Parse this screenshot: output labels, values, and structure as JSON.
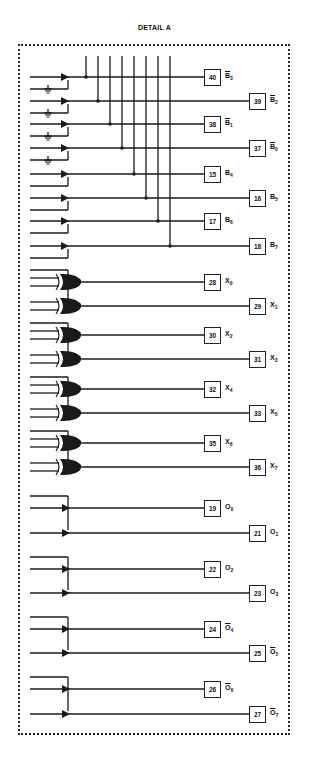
{
  "title": "DETAIL A",
  "bus_lines_x": [
    86,
    98,
    110,
    122,
    134,
    146,
    158,
    170
  ],
  "groups": {
    "buffers": {
      "rows": [
        {
          "pin": "40",
          "signal": "B",
          "sub": "3",
          "bar": true,
          "y": 77,
          "box": "near",
          "ground": true,
          "bus": 0
        },
        {
          "pin": "39",
          "signal": "B",
          "sub": "2",
          "bar": true,
          "y": 101,
          "box": "far",
          "ground": true,
          "bus": 1
        },
        {
          "pin": "38",
          "signal": "B",
          "sub": "1",
          "bar": true,
          "y": 124,
          "box": "near",
          "ground": true,
          "bus": 2
        },
        {
          "pin": "37",
          "signal": "B",
          "sub": "0",
          "bar": true,
          "y": 148,
          "box": "far",
          "ground": true,
          "bus": 3
        },
        {
          "pin": "15",
          "signal": "B",
          "sub": "4",
          "bar": false,
          "y": 174,
          "box": "near",
          "ground": false,
          "bus": 4
        },
        {
          "pin": "16",
          "signal": "B",
          "sub": "5",
          "bar": false,
          "y": 198,
          "box": "far",
          "ground": false,
          "bus": 5
        },
        {
          "pin": "17",
          "signal": "B",
          "sub": "6",
          "bar": false,
          "y": 221,
          "box": "near",
          "ground": false,
          "bus": 6
        },
        {
          "pin": "18",
          "signal": "B",
          "sub": "7",
          "bar": false,
          "y": 246,
          "box": "far",
          "ground": false,
          "bus": 7
        }
      ]
    },
    "xor_gates": {
      "rows": [
        {
          "pin": "28",
          "signal": "X",
          "sub": "0",
          "bar": false,
          "y": 282,
          "box": "near"
        },
        {
          "pin": "29",
          "signal": "X",
          "sub": "1",
          "bar": false,
          "y": 306,
          "box": "far"
        },
        {
          "pin": "30",
          "signal": "X",
          "sub": "2",
          "bar": false,
          "y": 335,
          "box": "near"
        },
        {
          "pin": "31",
          "signal": "X",
          "sub": "3",
          "bar": false,
          "y": 359,
          "box": "far"
        },
        {
          "pin": "32",
          "signal": "X",
          "sub": "4",
          "bar": false,
          "y": 389,
          "box": "near"
        },
        {
          "pin": "33",
          "signal": "X",
          "sub": "5",
          "bar": false,
          "y": 413,
          "box": "far"
        },
        {
          "pin": "35",
          "signal": "X",
          "sub": "6",
          "bar": false,
          "y": 443,
          "box": "near"
        },
        {
          "pin": "36",
          "signal": "X",
          "sub": "7",
          "bar": false,
          "y": 467,
          "box": "far"
        }
      ]
    },
    "outputs": {
      "rows": [
        {
          "pin": "19",
          "signal": "O",
          "sub": "0",
          "bar": false,
          "y": 508,
          "box": "near"
        },
        {
          "pin": "21",
          "signal": "O",
          "sub": "1",
          "bar": false,
          "y": 533,
          "box": "far"
        },
        {
          "pin": "22",
          "signal": "O",
          "sub": "2",
          "bar": false,
          "y": 569,
          "box": "near"
        },
        {
          "pin": "23",
          "signal": "O",
          "sub": "3",
          "bar": false,
          "y": 593,
          "box": "far"
        },
        {
          "pin": "24",
          "signal": "O",
          "sub": "4",
          "bar": true,
          "y": 629,
          "box": "near"
        },
        {
          "pin": "25",
          "signal": "O",
          "sub": "5",
          "bar": true,
          "y": 653,
          "box": "far"
        },
        {
          "pin": "26",
          "signal": "O",
          "sub": "6",
          "bar": true,
          "y": 689,
          "box": "near"
        },
        {
          "pin": "27",
          "signal": "O",
          "sub": "7",
          "bar": true,
          "y": 714,
          "box": "far"
        }
      ]
    }
  }
}
